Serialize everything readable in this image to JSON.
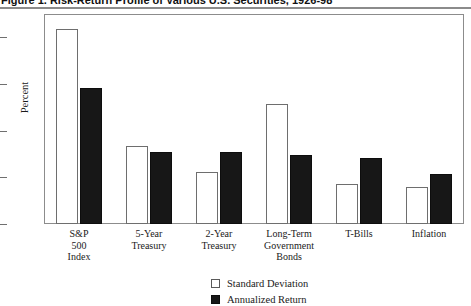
{
  "figure": {
    "title": "Figure 1. Risk-Return Profile of Various U.S. Securities, 1926-98",
    "ylabel": "Percent"
  },
  "legend": {
    "items": [
      {
        "label": "Standard Deviation",
        "swatch": "white-square-icon",
        "color": "#ffffff"
      },
      {
        "label": "Annualized Return",
        "swatch": "black-square-icon",
        "color": "#171717"
      }
    ]
  },
  "chart_data": {
    "type": "bar",
    "title": "Figure 1. Risk-Return Profile of Various U.S. Securities, 1926-98",
    "xlabel": "",
    "ylabel": "Percent",
    "ylim": [
      0,
      18
    ],
    "yticks": [
      0,
      4,
      8,
      12,
      16,
      18
    ],
    "ytick_labels": [
      "0",
      "4",
      "8",
      "12",
      "16",
      "18"
    ],
    "grid": false,
    "legend_position": "bottom-right",
    "categories": [
      "S&P 500 Index",
      "5-Year Treasury",
      "2-Year Treasury",
      "Long-Term Government Bonds",
      "T-Bills",
      "Inflation"
    ],
    "category_lines": [
      [
        "S&P",
        "500",
        "Index"
      ],
      [
        "5-Year",
        "Treasury"
      ],
      [
        "2-Year",
        "Treasury"
      ],
      [
        "Long-Term",
        "Government",
        "Bonds"
      ],
      [
        "T-Bills"
      ],
      [
        "Inflation"
      ]
    ],
    "series": [
      {
        "name": "Standard Deviation",
        "color": "#ffffff",
        "values": [
          16.7,
          6.7,
          4.5,
          10.3,
          3.4,
          3.2
        ]
      },
      {
        "name": "Annualized Return",
        "color": "#171717",
        "values": [
          11.7,
          6.2,
          6.2,
          5.9,
          5.7,
          4.3
        ]
      }
    ]
  }
}
